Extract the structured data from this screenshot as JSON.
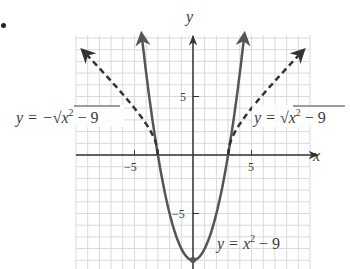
{
  "chart_data": {
    "type": "line",
    "title": "",
    "xlabel": "x",
    "ylabel": "y",
    "xlim": [
      -10,
      10
    ],
    "ylim": [
      -10,
      10
    ],
    "grid": true,
    "grid_step": 1,
    "x_ticks": [
      {
        "value": -5,
        "label": "−5"
      },
      {
        "value": 5,
        "label": "5"
      }
    ],
    "y_ticks": [
      {
        "value": 5,
        "label": "5"
      },
      {
        "value": -5,
        "label": "−5"
      }
    ],
    "series": [
      {
        "name": "y = x² − 9",
        "style": "solid",
        "color": "#555555",
        "function": "x^2 - 9",
        "points": [
          [
            -4.4,
            10.4
          ],
          [
            -4,
            7
          ],
          [
            -3,
            0
          ],
          [
            -2,
            -5
          ],
          [
            -1,
            -8
          ],
          [
            0,
            -9
          ],
          [
            1,
            -8
          ],
          [
            2,
            -5
          ],
          [
            3,
            0
          ],
          [
            4,
            7
          ],
          [
            4.4,
            10.4
          ]
        ],
        "arrows": "both-ends"
      },
      {
        "name": "y = −√(x² − 9)",
        "label_text": "y = −√x² − 9",
        "style": "dashed",
        "color": "#333333",
        "function": "sqrt(x^2 - 9) for x <= -3",
        "points": [
          [
            -3,
            0
          ],
          [
            -3.5,
            1.8
          ],
          [
            -4,
            2.65
          ],
          [
            -5,
            4
          ],
          [
            -6,
            5.2
          ],
          [
            -7,
            6.3
          ],
          [
            -8,
            7.4
          ],
          [
            -9.5,
            9.0
          ]
        ],
        "arrows": "end"
      },
      {
        "name": "y = √(x² − 9)",
        "label_text": "y = √x² − 9",
        "style": "dashed",
        "color": "#333333",
        "function": "sqrt(x^2 - 9) for x >= 3",
        "points": [
          [
            3,
            0
          ],
          [
            3.5,
            1.8
          ],
          [
            4,
            2.65
          ],
          [
            5,
            4
          ],
          [
            6,
            5.2
          ],
          [
            7,
            6.3
          ],
          [
            8,
            7.4
          ],
          [
            9.5,
            9.0
          ]
        ],
        "arrows": "end"
      }
    ],
    "annotations": [
      {
        "text": "y = −√x² − 9",
        "position": "left of grid, y≈3"
      },
      {
        "text": "y = √x² − 9",
        "position": "right, y≈3"
      },
      {
        "text": "y = x² − 9",
        "position": "bottom right, y≈−8"
      }
    ]
  },
  "labels": {
    "x_axis": "x",
    "y_axis": "y",
    "tick_x_neg5": "−5",
    "tick_x_pos5": "5",
    "tick_y_pos5": "5",
    "tick_y_neg5": "−5",
    "eq_left_prefix": "y = −",
    "eq_left_radicand": "x",
    "eq_left_exp": "2",
    "eq_left_tail": " − 9",
    "eq_right_prefix": "y = ",
    "eq_right_radicand": "x",
    "eq_right_exp": "2",
    "eq_right_tail": " − 9",
    "eq_parab_prefix": "y = x",
    "eq_parab_exp": "2",
    "eq_parab_tail": " − 9"
  },
  "colors": {
    "grid": "#d9d9d9",
    "axis": "#333333",
    "curve": "#555555",
    "text": "#3a3a3a"
  }
}
